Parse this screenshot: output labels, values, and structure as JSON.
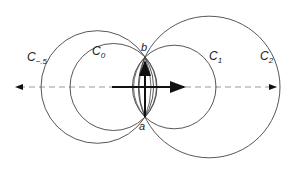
{
  "diagram": {
    "title": "",
    "colors": {
      "stroke": "#333333",
      "dashed_axis": "#888888",
      "arrow": "#111111"
    },
    "points": [
      {
        "id": "b",
        "label": "b",
        "x": 145,
        "y": 57
      },
      {
        "id": "a",
        "label": "a",
        "x": 145,
        "y": 117
      }
    ],
    "circles": [
      {
        "id": "C_-5",
        "label_main": "C",
        "label_sub": "−.5",
        "cx": 97.3,
        "cy": 87,
        "r": 56.3
      },
      {
        "id": "C_0",
        "label_main": "C",
        "label_sub": "0",
        "cx": 113.5,
        "cy": 87,
        "r": 43.5
      },
      {
        "id": "C_1",
        "label_main": "C",
        "label_sub": "1",
        "cx": 174.2,
        "cy": 87,
        "r": 41.8
      },
      {
        "id": "C_2",
        "label_main": "C",
        "label_sub": "2",
        "cx": 209.2,
        "cy": 87,
        "r": 70.8
      }
    ],
    "axis": {
      "style": "dashed",
      "y": 87,
      "x_from": 12,
      "x_to": 278,
      "arrows": "both"
    },
    "vectors": [
      {
        "id": "vertical",
        "from": [
          145,
          117
        ],
        "to": [
          145,
          60
        ]
      },
      {
        "id": "horizontal",
        "from": [
          112,
          87
        ],
        "to": [
          188,
          87
        ]
      }
    ]
  }
}
